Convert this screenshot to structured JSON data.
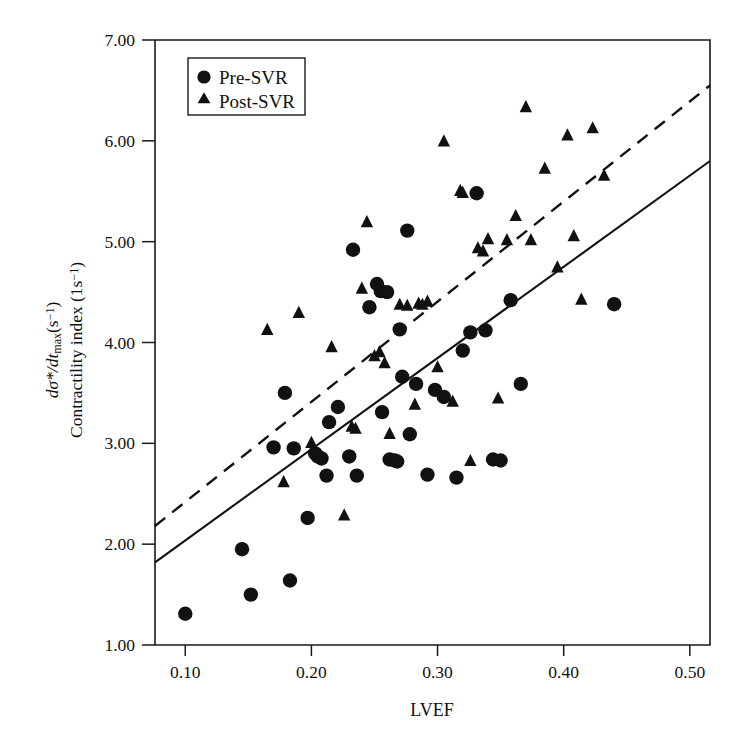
{
  "chart_data": {
    "type": "scatter",
    "title": "",
    "xlabel": "LVEF",
    "ylabel_line1": "dσ*/dt",
    "ylabel_line1_sub": "max",
    "ylabel_line1_unit": "(s",
    "ylabel_line1_exp": "−1",
    "ylabel_line1_close": ")",
    "ylabel_line2": "Contractility index (1s",
    "ylabel_line2_exp": "−1",
    "ylabel_line2_close": ")",
    "xlim": [
      0.076,
      0.516
    ],
    "ylim": [
      1.0,
      7.0
    ],
    "xticks": [
      0.1,
      0.2,
      0.3,
      0.4,
      0.5
    ],
    "xtick_labels": [
      "0.10",
      "0.20",
      "0.30",
      "0.40",
      "0.50"
    ],
    "yticks": [
      1.0,
      2.0,
      3.0,
      4.0,
      5.0,
      6.0,
      7.0
    ],
    "ytick_labels": [
      "1.00",
      "2.00",
      "3.00",
      "4.00",
      "5.00",
      "6.00",
      "7.00"
    ],
    "grid": false,
    "legend_position": "upper-left",
    "marker_color": "#111111",
    "series": [
      {
        "name": "Pre-SVR",
        "marker": "circle",
        "points": [
          [
            0.1,
            1.31
          ],
          [
            0.145,
            1.95
          ],
          [
            0.152,
            1.5
          ],
          [
            0.17,
            2.96
          ],
          [
            0.179,
            3.5
          ],
          [
            0.183,
            1.64
          ],
          [
            0.186,
            2.95
          ],
          [
            0.197,
            2.26
          ],
          [
            0.203,
            2.9
          ],
          [
            0.205,
            2.87
          ],
          [
            0.208,
            2.85
          ],
          [
            0.212,
            2.68
          ],
          [
            0.214,
            3.21
          ],
          [
            0.221,
            3.36
          ],
          [
            0.23,
            2.87
          ],
          [
            0.233,
            4.92
          ],
          [
            0.236,
            2.68
          ],
          [
            0.246,
            4.35
          ],
          [
            0.252,
            4.58
          ],
          [
            0.255,
            4.51
          ],
          [
            0.256,
            3.31
          ],
          [
            0.26,
            4.5
          ],
          [
            0.262,
            2.84
          ],
          [
            0.266,
            2.83
          ],
          [
            0.268,
            2.82
          ],
          [
            0.27,
            4.13
          ],
          [
            0.272,
            3.66
          ],
          [
            0.276,
            5.11
          ],
          [
            0.278,
            3.09
          ],
          [
            0.283,
            3.59
          ],
          [
            0.292,
            2.69
          ],
          [
            0.298,
            3.53
          ],
          [
            0.305,
            3.46
          ],
          [
            0.315,
            2.66
          ],
          [
            0.32,
            3.92
          ],
          [
            0.326,
            4.1
          ],
          [
            0.331,
            5.48
          ],
          [
            0.338,
            4.12
          ],
          [
            0.344,
            2.84
          ],
          [
            0.35,
            2.83
          ],
          [
            0.358,
            4.42
          ],
          [
            0.366,
            3.59
          ],
          [
            0.44,
            4.38
          ]
        ]
      },
      {
        "name": "Post-SVR",
        "marker": "triangle",
        "points": [
          [
            0.165,
            4.12
          ],
          [
            0.178,
            2.61
          ],
          [
            0.19,
            4.29
          ],
          [
            0.2,
            3.0
          ],
          [
            0.216,
            3.95
          ],
          [
            0.226,
            2.28
          ],
          [
            0.232,
            3.16
          ],
          [
            0.235,
            3.14
          ],
          [
            0.24,
            4.53
          ],
          [
            0.244,
            5.19
          ],
          [
            0.25,
            3.86
          ],
          [
            0.254,
            3.9
          ],
          [
            0.258,
            3.79
          ],
          [
            0.262,
            3.09
          ],
          [
            0.27,
            4.37
          ],
          [
            0.276,
            4.36
          ],
          [
            0.282,
            3.38
          ],
          [
            0.285,
            4.38
          ],
          [
            0.288,
            4.37
          ],
          [
            0.292,
            4.4
          ],
          [
            0.3,
            3.75
          ],
          [
            0.305,
            5.99
          ],
          [
            0.312,
            3.41
          ],
          [
            0.318,
            5.5
          ],
          [
            0.32,
            5.48
          ],
          [
            0.326,
            2.82
          ],
          [
            0.332,
            4.93
          ],
          [
            0.336,
            4.9
          ],
          [
            0.34,
            5.02
          ],
          [
            0.348,
            3.44
          ],
          [
            0.355,
            5.01
          ],
          [
            0.362,
            5.25
          ],
          [
            0.37,
            6.33
          ],
          [
            0.374,
            5.01
          ],
          [
            0.385,
            5.72
          ],
          [
            0.395,
            4.74
          ],
          [
            0.403,
            6.05
          ],
          [
            0.408,
            5.05
          ],
          [
            0.414,
            4.42
          ],
          [
            0.423,
            6.12
          ],
          [
            0.432,
            5.65
          ]
        ]
      }
    ],
    "fit_lines": [
      {
        "name": "Pre-SVR fit",
        "style": "solid",
        "x0": 0.076,
        "y0": 1.82,
        "x1": 0.516,
        "y1": 5.8
      },
      {
        "name": "Post-SVR fit",
        "style": "dashed",
        "x0": 0.076,
        "y0": 2.18,
        "x1": 0.516,
        "y1": 6.55
      }
    ],
    "legend": [
      {
        "label": "Pre-SVR",
        "marker": "circle"
      },
      {
        "label": "Post-SVR",
        "marker": "triangle"
      }
    ]
  }
}
